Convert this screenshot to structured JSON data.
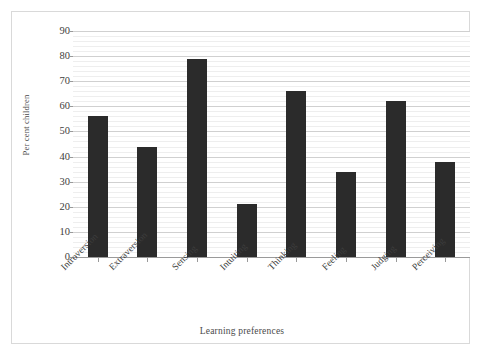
{
  "chart_data": {
    "type": "bar",
    "title": "",
    "subtitle": "",
    "xlabel": "Learning preferences",
    "ylabel": "Per cent children",
    "categories": [
      "Introversion",
      "Extraversion",
      "Sensing",
      "Intuiting",
      "Thinking",
      "Feeling",
      "Judging",
      "Perceiving"
    ],
    "values": [
      56,
      44,
      79,
      21,
      66,
      34,
      62,
      38
    ],
    "series": [
      {
        "name": "Per cent children",
        "values": [
          56,
          44,
          79,
          21,
          66,
          34,
          62,
          38
        ]
      }
    ],
    "ylim": [
      0,
      90
    ],
    "ytick_labels": [
      "0",
      "10",
      "20",
      "30",
      "40",
      "50",
      "60",
      "70",
      "80",
      "90"
    ],
    "ytick_values": [
      0,
      10,
      20,
      30,
      40,
      50,
      60,
      70,
      80,
      90
    ],
    "ytick_step": 10,
    "yminor_step": 2,
    "grid": "horizontal-major-and-minor",
    "legend": "none",
    "legend_position": "none",
    "bar_color": "#2b2b2b",
    "grid_color": "#eeeeee",
    "major_grid_color": "#d0d0d0",
    "axis_color": "#9a9a9a",
    "frame_border_color": "#d9d9d9",
    "background_color": "#ffffff",
    "xtick_rotation_degrees": -45,
    "annotations": []
  }
}
